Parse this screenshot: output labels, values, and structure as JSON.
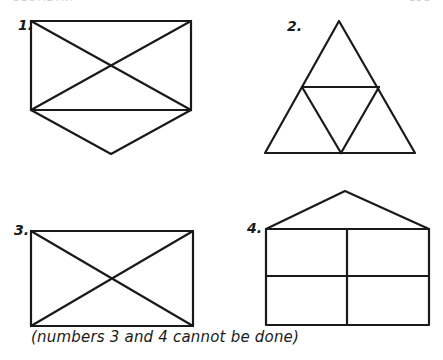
{
  "header": {
    "left": "GEOMETRY",
    "right": "151"
  },
  "figures": [
    {
      "label": "1.",
      "description": "rectangle with both diagonals and a V-shaped point below"
    },
    {
      "label": "2.",
      "description": "triangle subdivided into four triangles"
    },
    {
      "label": "3.",
      "description": "rectangle with both diagonals"
    },
    {
      "label": "4.",
      "description": "house shape: triangle roof over rectangle divided into four cells"
    }
  ],
  "caption": "(numbers 3 and 4 cannot be done)",
  "colors": {
    "ink": "#1a1a1a",
    "paper": "#ffffff"
  }
}
